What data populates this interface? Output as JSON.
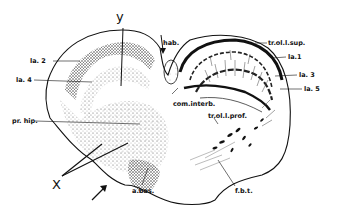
{
  "figure": {
    "labels": {
      "y": "y",
      "hab": "hab.",
      "tr_ol_l_sup": "tr.ol.l.sup.",
      "la1": "la.1",
      "la2": "la. 2",
      "la3": "la. 3",
      "la4": "la. 4",
      "la5": "la. 5",
      "com_interb": "com.interb.",
      "tr_ol_l_prof": "tr.ol.l.prof.",
      "pr_hip": "pr. hip.",
      "x": "X",
      "a_bas": "a.bas.",
      "f_b_t": "f.b.t."
    }
  }
}
